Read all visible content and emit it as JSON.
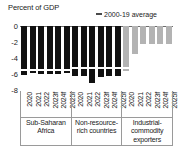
{
  "chart_data": {
    "type": "bar",
    "title": "Percent of GDP",
    "xlabel": "",
    "ylabel": "Percent of GDP",
    "ylim": [
      -8,
      0
    ],
    "yticks": [
      0,
      -2,
      -4,
      -6,
      -8
    ],
    "ytick_labels": [
      "0",
      "-2",
      "-4",
      "-6",
      "-8"
    ],
    "grid": false,
    "legend": {
      "position": "top-right",
      "entries": [
        {
          "label": "2000-19 average",
          "marker": "dash",
          "color": "#4a4a4a"
        }
      ]
    },
    "categories": [
      "2020",
      "2021",
      "2022",
      "2023f",
      "2024f",
      "2025f"
    ],
    "groups": [
      {
        "name": "Sub-Saharan Africa",
        "caption_lines": [
          "Sub-Saharan",
          "Africa"
        ],
        "color": "#111111",
        "bar_style": "dark",
        "average": -5.5,
        "average_color": "#ffffff",
        "values": [
          -6.1,
          -5.9,
          -6.0,
          -6.0,
          -6.0,
          -5.9
        ]
      },
      {
        "name": "Non-resource-rich countries",
        "caption_lines": [
          "Non-resource-",
          "rich countries"
        ],
        "color": "#111111",
        "bar_style": "dark",
        "average": -5.2,
        "average_color": "#ffffff",
        "values": [
          -6.3,
          -6.2,
          -7.1,
          -6.4,
          -6.3,
          -6.3
        ]
      },
      {
        "name": "Industrial-commodity exporters",
        "caption_lines": [
          "Industrial-",
          "commodity",
          "exporters"
        ],
        "color": "#b3b3b3",
        "bar_style": "light",
        "average": -5.3,
        "average_color": "#ffffff",
        "values": [
          -5.6,
          -3.5,
          -2.2,
          -2.3,
          -2.3,
          -2.2
        ]
      }
    ],
    "colors": {
      "bar_dark": "#111111",
      "bar_light": "#b3b3b3",
      "axis": "#6d6d6d",
      "text": "#1a1a1a"
    }
  }
}
